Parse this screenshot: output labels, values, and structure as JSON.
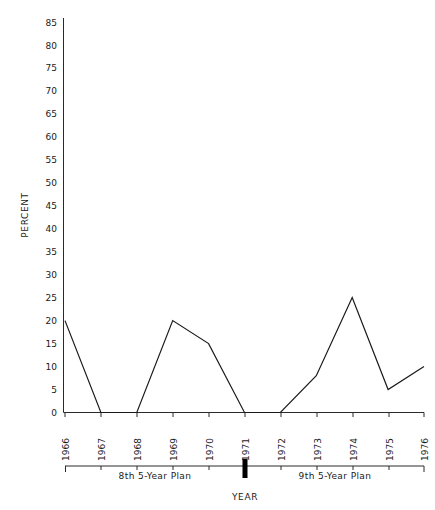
{
  "chart_data": {
    "type": "line",
    "title": "",
    "xlabel": "YEAR",
    "ylabel": "PERCENT",
    "x": [
      1966,
      1967,
      1968,
      1969,
      1970,
      1971,
      1972,
      1973,
      1974,
      1975,
      1976
    ],
    "categories": [
      "1966",
      "1967",
      "1968",
      "1969",
      "1970",
      "1971",
      "1972",
      "1973",
      "1974",
      "1975",
      "1976"
    ],
    "values": [
      20,
      0,
      0,
      20,
      15,
      0,
      0,
      8,
      25,
      5,
      10
    ],
    "series": [
      {
        "name": "percent",
        "values": [
          20,
          0,
          0,
          20,
          15,
          0,
          0,
          8,
          25,
          5,
          10
        ]
      }
    ],
    "ylim": [
      0,
      85
    ],
    "ytick_step": 5,
    "yticks": [
      0,
      5,
      10,
      15,
      20,
      25,
      30,
      35,
      40,
      45,
      50,
      55,
      60,
      65,
      70,
      75,
      80,
      85
    ],
    "ytick_labels": [
      "0",
      "5",
      "10",
      "15",
      "20",
      "25",
      "30",
      "35",
      "40",
      "45",
      "50",
      "55",
      "60",
      "65",
      "70",
      "75",
      "80",
      "85"
    ],
    "xlim": [
      1966,
      1976
    ],
    "grid": false,
    "legend": false,
    "legend_position": "none",
    "annotations": [
      {
        "text": "8th 5-Year Plan",
        "span": [
          "1966",
          "1971"
        ]
      },
      {
        "text": "9th 5-Year Plan",
        "span": [
          "1971",
          "1976"
        ]
      }
    ]
  },
  "axes": {
    "y_title": "PERCENT",
    "x_title": "YEAR"
  },
  "plan_bands": [
    {
      "label": "8th 5-Year Plan",
      "start_year": "1966",
      "end_year": "1971"
    },
    {
      "label": "9th 5-Year Plan",
      "start_year": "1971",
      "end_year": "1976"
    }
  ],
  "divider": {
    "at_year": "1971",
    "color": "#000000"
  },
  "style": {
    "line_color": "#1a1a1a",
    "axis_color": "#2a2a2a",
    "background": "#ffffff"
  }
}
